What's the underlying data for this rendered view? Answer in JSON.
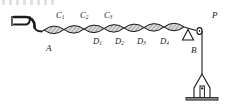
{
  "figure": {
    "stroke_color": "#1a1a1a",
    "fill_color": "#d8d8d8",
    "background": "#ffffff"
  },
  "labels": {
    "source": {
      "text": "A",
      "base": "A",
      "sub": ""
    },
    "crest_nodes": [
      {
        "text": "C1",
        "base": "C",
        "sub": "1"
      },
      {
        "text": "C2",
        "base": "C",
        "sub": "2"
      },
      {
        "text": "C3",
        "base": "C",
        "sub": "3"
      }
    ],
    "trough_nodes": [
      {
        "text": "D1",
        "base": "D",
        "sub": "1"
      },
      {
        "text": "D2",
        "base": "D",
        "sub": "2"
      },
      {
        "text": "D3",
        "base": "D",
        "sub": "3"
      },
      {
        "text": "D4",
        "base": "D",
        "sub": "4"
      }
    ],
    "pulley": {
      "text": "P",
      "base": "P",
      "sub": ""
    },
    "hanging_segment": {
      "text": "B",
      "base": "B",
      "sub": ""
    }
  },
  "components": {
    "tuning_fork": "tuning-fork-icon",
    "string": "vibrating-string",
    "loops_count": 7,
    "knife_edge_support": "triangular-support-icon",
    "pulley_wheel": "pulley-icon",
    "weight_hanger": "weight-hanger-icon",
    "base_stand": "base-stand"
  }
}
